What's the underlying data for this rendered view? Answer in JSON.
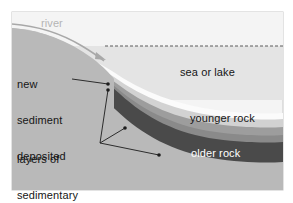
{
  "figure": {
    "type": "geological-cross-section",
    "panel": {
      "x": 12,
      "y": 12,
      "width": 271,
      "height": 178
    },
    "background_color": "#ffffff",
    "border_color": "#c8c8c8"
  },
  "labels": {
    "river": "river",
    "new_sediment": "new\nsediment\ndeposited",
    "new_sediment_lines": [
      "new",
      "sediment",
      "deposited"
    ],
    "layers_build_up": "layers of\nsedimentary\nrock build up",
    "layers_build_up_lines": [
      "layers of",
      "sedimentary",
      "rock build up"
    ],
    "sea_or_lake": "sea or lake",
    "younger_rock": "younger rock",
    "older_rock": "older rock"
  },
  "colors": {
    "sky": "#f4f4f4",
    "water": "#e4e4e4",
    "water_surface_line": "#5a5a5a",
    "landmass": "#b9b9b9",
    "new_sediment": "#fbfbfb",
    "upper_rock": "#d2d2d2",
    "younger_rock": "#9d9d9d",
    "mid_rock": "#8a8a8a",
    "older_rock": "#4a4a4a",
    "basement": "#b9b9b9",
    "river_text": "#b4b4b4",
    "river_line": "#a8a8a8",
    "leader_line": "#1c1c1c",
    "label_dark": "#161616",
    "label_light": "#ffffff"
  },
  "leaders": {
    "new_sediment": {
      "from": [
        72,
        79
      ],
      "to": [
        108,
        84
      ],
      "dot": [
        108,
        84
      ]
    },
    "layers": [
      {
        "from": [
          100,
          143
        ],
        "to": [
          108,
          90
        ],
        "dot": [
          108,
          90
        ]
      },
      {
        "from": [
          100,
          143
        ],
        "to": [
          125,
          128
        ],
        "dot": [
          125,
          128
        ]
      },
      {
        "from": [
          100,
          143
        ],
        "to": [
          159,
          155
        ],
        "dot": [
          159,
          155
        ]
      }
    ]
  },
  "strata": [
    {
      "name": "sky",
      "order": 0,
      "label": null
    },
    {
      "name": "water",
      "order": 1,
      "label": "sea or lake"
    },
    {
      "name": "landmass",
      "order": 2,
      "label": null
    },
    {
      "name": "new_sediment",
      "order": 3,
      "label": "new sediment deposited"
    },
    {
      "name": "upper_rock",
      "order": 4,
      "label": null
    },
    {
      "name": "younger_rock",
      "order": 5,
      "label": "younger rock"
    },
    {
      "name": "mid_rock",
      "order": 6,
      "label": null
    },
    {
      "name": "older_rock",
      "order": 7,
      "label": "older rock"
    },
    {
      "name": "basement",
      "order": 8,
      "label": null
    }
  ]
}
